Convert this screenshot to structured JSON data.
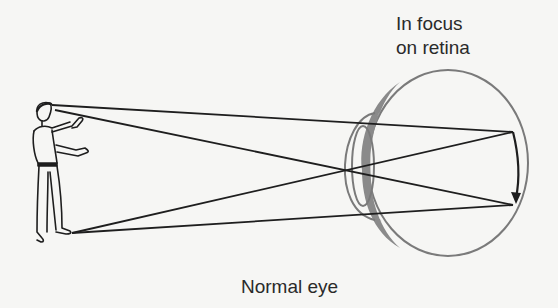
{
  "figure": {
    "top_label_line1": "In focus",
    "top_label_line2": "on retina",
    "caption": "Normal eye"
  },
  "elements": {
    "object": "standing-person",
    "eye": "eye-cross-section",
    "image_on_retina": "inverted-arrow"
  },
  "colors": {
    "ray": "#1e1e1e",
    "eye_outline": "#7a7a7a",
    "lens_fill": "#8a8a8a",
    "background": "#f6f6f4"
  }
}
